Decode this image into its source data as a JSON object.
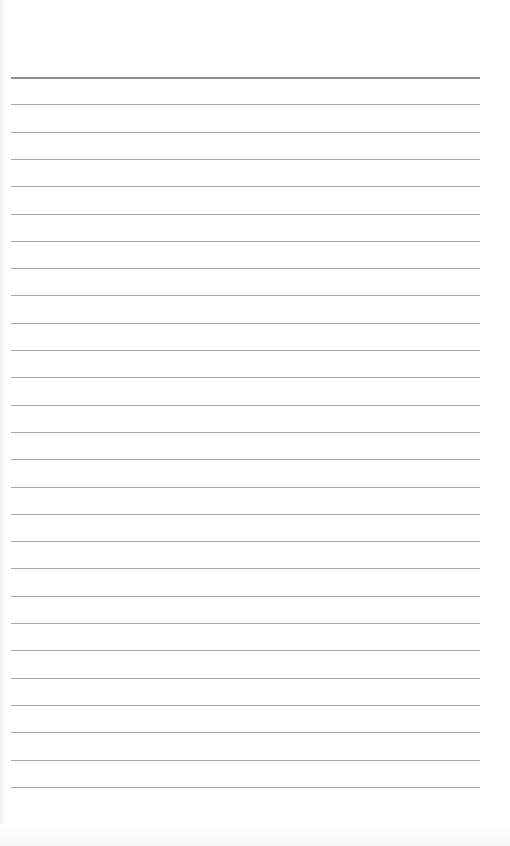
{
  "page": {
    "type": "lined-notebook-page",
    "background_color": "#ffffff",
    "line_color": "#a9a9a9",
    "top_line_color": "#8f8f8f",
    "line_count": 27,
    "first_line_y": 77,
    "line_spacing": 27.3,
    "line_left": 11,
    "line_width": 469,
    "text": ""
  }
}
